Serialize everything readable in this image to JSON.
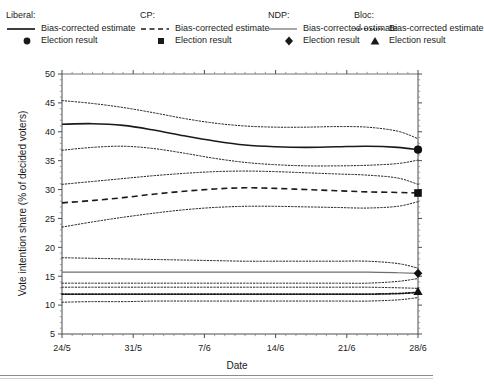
{
  "legend": {
    "entries": [
      {
        "party": "Liberal:",
        "line_label": "Bias-corrected estimate",
        "marker_label": "Election result",
        "line_style": "solid",
        "marker": "circle",
        "color": "#1a1a1a"
      },
      {
        "party": "CP:",
        "line_label": "Bias-corrected estimate",
        "marker_label": "Election result",
        "line_style": "dashed",
        "marker": "square",
        "color": "#1a1a1a"
      },
      {
        "party": "NDP:",
        "line_label": "Bias-corrected estimate",
        "marker_label": "Election result",
        "line_style": "thin-solid",
        "marker": "diamond",
        "color": "#6e6e6e"
      },
      {
        "party": "Bloc:",
        "line_label": "Bias-corrected estimate",
        "marker_label": "Election result",
        "line_style": "dotted",
        "marker": "triangle",
        "color": "#1a1a1a"
      }
    ]
  },
  "chart_data": {
    "type": "line",
    "title": "",
    "xlabel": "Date",
    "ylabel": "Vote intention share (% of decided voters)",
    "xtick_labels": [
      "24/5",
      "31/5",
      "7/6",
      "14/6",
      "21/6",
      "28/6"
    ],
    "xtick_days": [
      0,
      7,
      14,
      21,
      28,
      35
    ],
    "xlim_days": [
      0,
      35
    ],
    "ytick_labels": [
      "5",
      "10",
      "15",
      "20",
      "25",
      "30",
      "35",
      "40",
      "45",
      "50"
    ],
    "ytick_values": [
      5,
      10,
      15,
      20,
      25,
      30,
      35,
      40,
      45,
      50
    ],
    "ylim": [
      5,
      50
    ],
    "grid": false,
    "minor_ticks": true,
    "legend_position": "above-plot",
    "series": [
      {
        "name": "Liberal bias-corrected estimate",
        "style": "solid",
        "width": 1.6,
        "color": "#1a1a1a",
        "x": [
          0,
          3,
          6,
          9,
          12,
          15,
          18,
          21,
          24,
          27,
          30,
          33,
          35
        ],
        "y": [
          41.3,
          41.4,
          41.1,
          40.3,
          39.3,
          38.4,
          37.7,
          37.4,
          37.3,
          37.4,
          37.5,
          37.3,
          36.9
        ]
      },
      {
        "name": "Liberal upper credible bound",
        "style": "dotted",
        "width": 1.0,
        "color": "#1a1a1a",
        "x": [
          0,
          3,
          6,
          9,
          12,
          15,
          18,
          21,
          24,
          27,
          30,
          33,
          35
        ],
        "y": [
          45.4,
          44.9,
          44.2,
          43.3,
          42.3,
          41.5,
          41.0,
          40.8,
          40.8,
          40.9,
          40.8,
          40.1,
          38.8
        ]
      },
      {
        "name": "Liberal lower credible bound",
        "style": "dotted",
        "width": 1.0,
        "color": "#1a1a1a",
        "x": [
          0,
          3,
          6,
          9,
          12,
          15,
          18,
          21,
          24,
          27,
          30,
          33,
          35
        ],
        "y": [
          36.8,
          37.3,
          37.5,
          37.1,
          36.3,
          35.4,
          34.7,
          34.3,
          34.1,
          34.1,
          34.2,
          34.5,
          35.1
        ]
      },
      {
        "name": "CP bias-corrected estimate",
        "style": "dashed",
        "width": 1.6,
        "color": "#1a1a1a",
        "x": [
          0,
          3,
          6,
          9,
          12,
          15,
          18,
          21,
          24,
          27,
          30,
          33,
          35
        ],
        "y": [
          27.7,
          28.1,
          28.6,
          29.2,
          29.7,
          30.1,
          30.3,
          30.2,
          30.0,
          29.8,
          29.6,
          29.5,
          29.4
        ]
      },
      {
        "name": "CP upper credible bound",
        "style": "dotted",
        "width": 1.0,
        "color": "#1a1a1a",
        "x": [
          0,
          3,
          6,
          9,
          12,
          15,
          18,
          21,
          24,
          27,
          30,
          33,
          35
        ],
        "y": [
          30.9,
          31.4,
          31.9,
          32.4,
          32.8,
          33.1,
          33.2,
          33.1,
          32.9,
          32.7,
          32.5,
          32.0,
          30.9
        ]
      },
      {
        "name": "CP lower credible bound",
        "style": "dotted",
        "width": 1.0,
        "color": "#1a1a1a",
        "x": [
          0,
          3,
          6,
          9,
          12,
          15,
          18,
          21,
          24,
          27,
          30,
          33,
          35
        ],
        "y": [
          23.5,
          24.4,
          25.2,
          25.9,
          26.5,
          26.9,
          27.1,
          27.1,
          27.0,
          26.9,
          26.8,
          27.1,
          27.9
        ]
      },
      {
        "name": "NDP bias-corrected estimate",
        "style": "thin-solid",
        "width": 1.2,
        "color": "#6e6e6e",
        "x": [
          0,
          3,
          6,
          9,
          12,
          15,
          18,
          21,
          24,
          27,
          30,
          33,
          35
        ],
        "y": [
          15.7,
          15.7,
          15.7,
          15.7,
          15.7,
          15.7,
          15.7,
          15.7,
          15.7,
          15.7,
          15.7,
          15.6,
          15.5
        ]
      },
      {
        "name": "NDP upper credible bound",
        "style": "dotted",
        "width": 1.0,
        "color": "#1a1a1a",
        "x": [
          0,
          3,
          6,
          9,
          12,
          15,
          18,
          21,
          24,
          27,
          30,
          33,
          35
        ],
        "y": [
          18.2,
          18.1,
          18.0,
          17.9,
          17.8,
          17.7,
          17.6,
          17.6,
          17.6,
          17.6,
          17.6,
          17.2,
          16.4
        ]
      },
      {
        "name": "NDP lower credible bound",
        "style": "dotted",
        "width": 1.0,
        "color": "#1a1a1a",
        "x": [
          0,
          3,
          6,
          9,
          12,
          15,
          18,
          21,
          24,
          27,
          30,
          33,
          35
        ],
        "y": [
          13.8,
          13.8,
          13.8,
          13.8,
          13.8,
          13.8,
          13.8,
          13.8,
          13.8,
          13.8,
          13.8,
          14.1,
          14.6
        ]
      },
      {
        "name": "Bloc bias-corrected estimate",
        "style": "dotted-heavy",
        "width": 1.8,
        "color": "#1a1a1a",
        "x": [
          0,
          3,
          6,
          9,
          12,
          15,
          18,
          21,
          24,
          27,
          30,
          33,
          35
        ],
        "y": [
          11.9,
          11.9,
          11.9,
          11.9,
          11.9,
          11.9,
          11.9,
          11.9,
          11.9,
          11.9,
          11.9,
          12.0,
          12.2
        ]
      },
      {
        "name": "Bloc upper credible bound",
        "style": "dotted",
        "width": 1.0,
        "color": "#1a1a1a",
        "x": [
          0,
          3,
          6,
          9,
          12,
          15,
          18,
          21,
          24,
          27,
          30,
          33,
          35
        ],
        "y": [
          13.1,
          13.1,
          13.1,
          13.1,
          13.1,
          13.1,
          13.1,
          13.1,
          13.1,
          13.1,
          13.1,
          13.0,
          12.9
        ]
      },
      {
        "name": "Bloc lower credible bound",
        "style": "dotted",
        "width": 1.0,
        "color": "#1a1a1a",
        "x": [
          0,
          3,
          6,
          9,
          12,
          15,
          18,
          21,
          24,
          27,
          30,
          33,
          35
        ],
        "y": [
          10.5,
          10.6,
          10.6,
          10.7,
          10.7,
          10.7,
          10.7,
          10.7,
          10.7,
          10.7,
          10.7,
          10.9,
          11.3
        ]
      }
    ],
    "election_results": [
      {
        "name": "Liberal",
        "marker": "circle",
        "x": 35,
        "y": 36.9
      },
      {
        "name": "CP",
        "marker": "square",
        "x": 35,
        "y": 29.4
      },
      {
        "name": "NDP",
        "marker": "diamond",
        "x": 35,
        "y": 15.5
      },
      {
        "name": "Bloc",
        "marker": "triangle",
        "x": 35,
        "y": 12.4
      }
    ]
  }
}
